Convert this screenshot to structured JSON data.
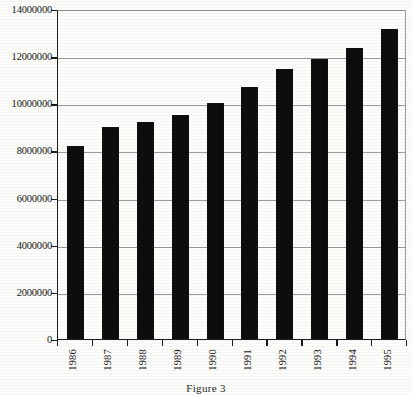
{
  "caption": "Figure 3",
  "chart_data": {
    "type": "bar",
    "title": "",
    "subtitle": "",
    "xlabel": "",
    "ylabel": "",
    "categories": [
      "1986",
      "1987",
      "1988",
      "1989",
      "1990",
      "1991",
      "1992",
      "1993",
      "1994",
      "1995"
    ],
    "values": [
      8200000,
      9000000,
      9200000,
      9500000,
      10000000,
      10700000,
      11450000,
      11900000,
      12350000,
      13150000
    ],
    "ylim": [
      0,
      14000000
    ],
    "ytick_values": [
      0,
      2000000,
      4000000,
      6000000,
      8000000,
      10000000,
      12000000,
      14000000
    ],
    "ytick_labels": [
      "0",
      "2000000",
      "4000000",
      "6000000",
      "8000000",
      "10000000",
      "12000000",
      "14000000"
    ],
    "grid": true,
    "grid_axis": "y",
    "legend": false,
    "legend_position": "none",
    "bar_color": "#0d0d0d",
    "background_color": "#fdfdfb",
    "axis_color": "#1a1a1a",
    "gridline_color": "#9b9b9b"
  }
}
